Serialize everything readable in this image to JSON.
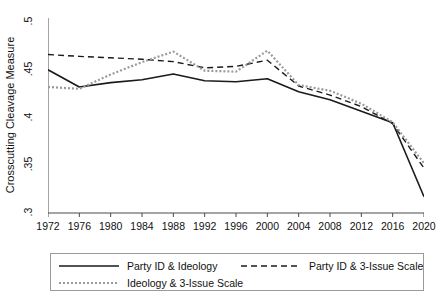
{
  "chart_data": {
    "type": "line",
    "title": "",
    "xlabel": "",
    "ylabel": "Crosscutting Cleavage Measure",
    "x": [
      1972,
      1976,
      1980,
      1984,
      1988,
      1992,
      1996,
      2000,
      2004,
      2008,
      2012,
      2016,
      2020
    ],
    "xlim": [
      1972,
      2020
    ],
    "ylim": [
      0.3,
      0.5
    ],
    "yticks": [
      0.5,
      0.45,
      0.4,
      0.35,
      0.3
    ],
    "ytick_labels": [
      ".5",
      ".45",
      ".4",
      ".35",
      ".3"
    ],
    "xticks": [
      1972,
      1976,
      1980,
      1984,
      1988,
      1992,
      1996,
      2000,
      2004,
      2008,
      2012,
      2016,
      2020
    ],
    "xtick_labels": [
      "1972",
      "1976",
      "1980",
      "1984",
      "1988",
      "1992",
      "1996",
      "2000",
      "2004",
      "2008",
      "2012",
      "2016",
      "2020"
    ],
    "grid": false,
    "legend_position": "below",
    "series": [
      {
        "name": "Party ID & Ideology",
        "style": "solid",
        "color": "#1a1a1a",
        "values": [
          0.45,
          0.432,
          0.4365,
          0.4395,
          0.4455,
          0.4385,
          0.4375,
          0.4405,
          0.427,
          0.4185,
          0.4065,
          0.3945,
          0.317
        ]
      },
      {
        "name": "Party ID & 3-Issue Scale",
        "style": "dashed",
        "color": "#1a1a1a",
        "values": [
          0.466,
          0.464,
          0.4625,
          0.461,
          0.4585,
          0.452,
          0.4535,
          0.46,
          0.433,
          0.4235,
          0.4115,
          0.3935,
          0.347
        ]
      },
      {
        "name": "Ideology & 3-Issue Scale",
        "style": "dotted",
        "color": "#9a9a9a",
        "values": [
          0.432,
          0.43,
          0.445,
          0.458,
          0.469,
          0.449,
          0.448,
          0.47,
          0.434,
          0.428,
          0.4145,
          0.395,
          0.352
        ]
      }
    ]
  },
  "axis": {
    "y_title": "Crosscutting Cleavage Measure"
  },
  "legend": {
    "entries": [
      {
        "label": "Party ID & Ideology",
        "key": "solid-line-key"
      },
      {
        "label": "Party ID & 3-Issue Scale",
        "key": "dashed-line-key"
      },
      {
        "label": "Ideology & 3-Issue Scale",
        "key": "dotted-line-key"
      }
    ]
  }
}
